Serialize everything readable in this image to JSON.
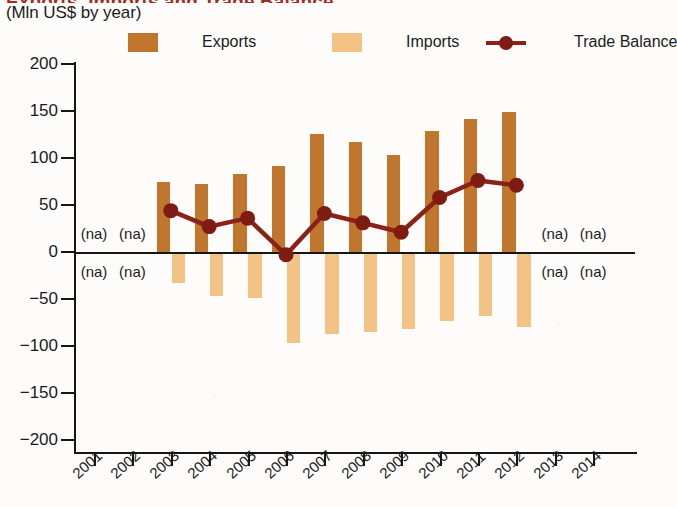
{
  "header": {
    "title_clipped": "Exports, Imports and Trade Balance",
    "subtitle": "(Mln US$ by year)"
  },
  "legend": {
    "items": [
      {
        "label": "Exports",
        "marker": "square-swatch",
        "color": "#C1762E"
      },
      {
        "label": "Imports",
        "marker": "square-swatch",
        "color": "#F3C285"
      },
      {
        "label": "Trade Balance",
        "marker": "line-with-dot",
        "color": "#8B2118"
      }
    ]
  },
  "annotations": {
    "na_text": "(na)",
    "na_years": [
      2001,
      2002,
      2013,
      2014
    ],
    "na_positions": [
      "above-axis",
      "below-axis"
    ]
  },
  "chart_data": {
    "type": "bar",
    "title": "Exports, Imports and Trade Balance",
    "subtitle": "(Mln US$ by year)",
    "xlabel": "",
    "ylabel": "Mln US$",
    "ylim": [
      -200,
      200
    ],
    "yticks": [
      200,
      150,
      100,
      50,
      0,
      -50,
      -100,
      -150,
      -200
    ],
    "ytick_labels": [
      "200",
      "150",
      "100",
      "50",
      "0",
      "-50",
      "-100",
      "-150",
      "-200"
    ],
    "categories": [
      2001,
      2002,
      2003,
      2004,
      2005,
      2006,
      2007,
      2008,
      2009,
      2010,
      2011,
      2012,
      2013,
      2014
    ],
    "xtick_labels": [
      "2001",
      "2002",
      "2003",
      "2004",
      "2005",
      "2006",
      "2007",
      "2008",
      "2009",
      "2010",
      "2011",
      "2012",
      "2013",
      "2014"
    ],
    "grid": false,
    "legend_position": "top",
    "series": [
      {
        "name": "Exports",
        "type": "bar",
        "color": "#C1762E",
        "values": [
          null,
          null,
          75,
          72,
          83,
          91,
          126,
          117,
          103,
          129,
          141,
          149,
          null,
          null
        ]
      },
      {
        "name": "Imports",
        "type": "bar",
        "color": "#F3C285",
        "values": [
          null,
          null,
          -33,
          -47,
          -49,
          -97,
          -87,
          -85,
          -82,
          -73,
          -68,
          -80,
          null,
          null
        ]
      },
      {
        "name": "Trade Balance",
        "type": "line",
        "color": "#8B2118",
        "values": [
          null,
          null,
          44,
          27,
          36,
          -3,
          41,
          31,
          21,
          58,
          76,
          71,
          null,
          null
        ]
      }
    ]
  }
}
